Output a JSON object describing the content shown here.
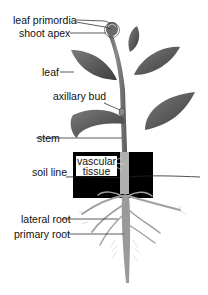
{
  "diagram": {
    "labels": {
      "leaf_primordia": "leaf primordia",
      "shoot_apex": "shoot apex",
      "leaf": "leaf",
      "axillary_bud": "axillary bud",
      "stem": "stem",
      "vascular_line1": "vascular",
      "vascular_line2": "tissue",
      "soil_line": "soil line",
      "lateral_root": "lateral root",
      "primary_root": "primary root"
    },
    "colors": {
      "leaf": "#5a5a5a",
      "leaf_dark": "#3c3c3c",
      "stem": "#6e6e6e",
      "root": "#9a9a9a",
      "soil_box": "#000000",
      "label_line": "#333333"
    }
  }
}
